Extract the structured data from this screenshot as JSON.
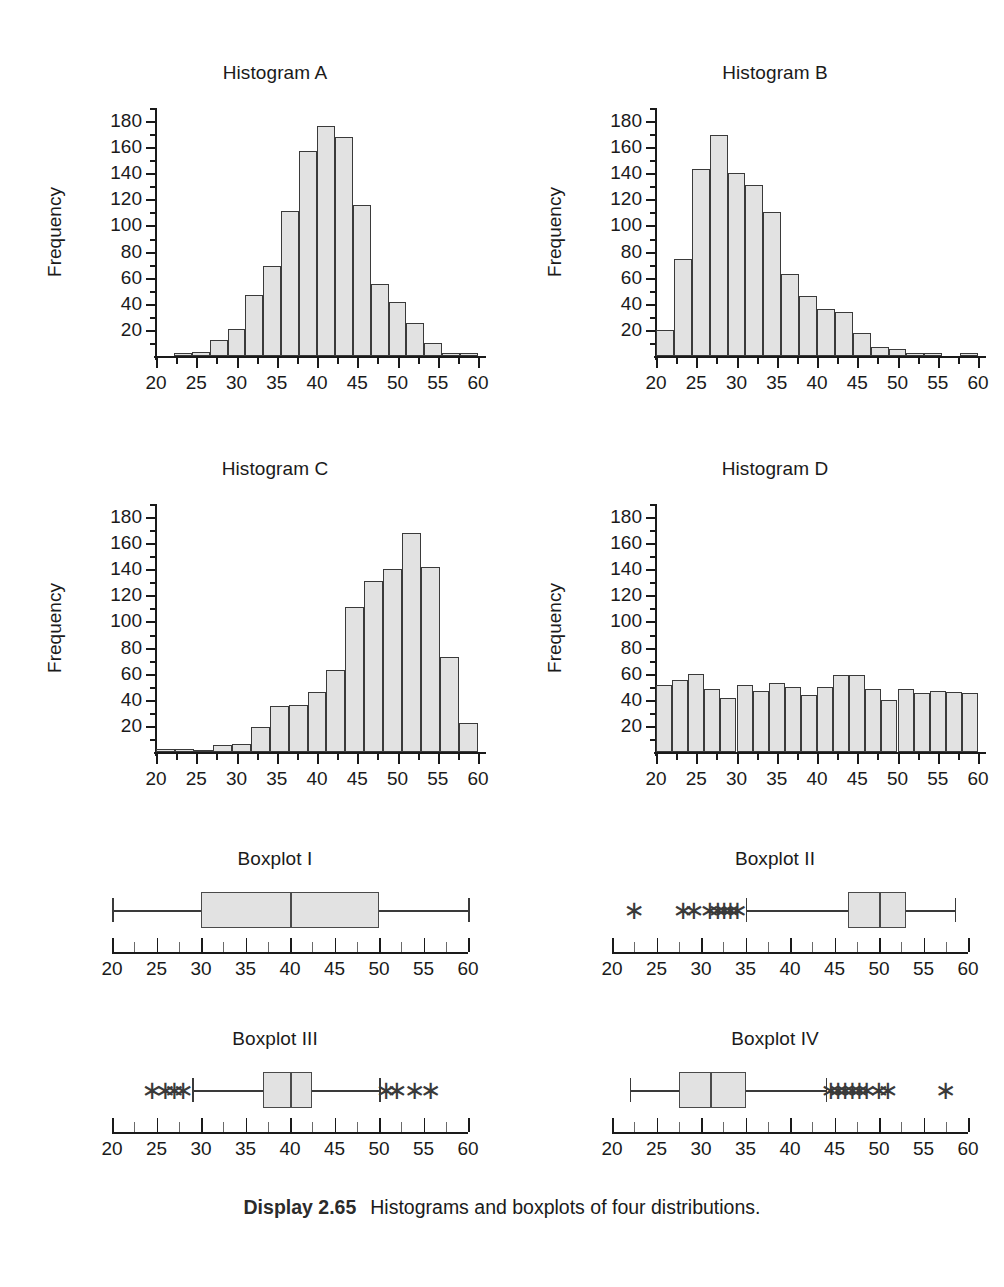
{
  "caption": {
    "lead": "Display 2.65",
    "text": "Histograms and boxplots of four distributions."
  },
  "axis": {
    "x_label_values": [
      "20",
      "25",
      "30",
      "35",
      "40",
      "45",
      "50",
      "55",
      "60"
    ],
    "y_label_values": [
      "20",
      "40",
      "60",
      "80",
      "100",
      "120",
      "140",
      "160",
      "180"
    ],
    "y_title": "Frequency",
    "x_min": 20,
    "x_max": 60,
    "y_min": 0,
    "y_max": 190
  },
  "titles": {
    "hist_a": "Histogram A",
    "hist_b": "Histogram B",
    "hist_c": "Histogram C",
    "hist_d": "Histogram D",
    "box_1": "Boxplot I",
    "box_2": "Boxplot II",
    "box_3": "Boxplot III",
    "box_4": "Boxplot IV"
  },
  "chart_data": [
    {
      "type": "bar",
      "name": "hist_a",
      "title": "Histogram A",
      "xlabel": "",
      "ylabel": "Frequency",
      "xlim": [
        20,
        60
      ],
      "ylim": [
        0,
        190
      ],
      "bin_width": 2.5,
      "grid": false,
      "shape": "symmetric / mound-shaped centered near 40",
      "bin_starts": [
        20,
        22.5,
        25,
        27.5,
        30,
        32.5,
        35,
        37.5,
        40,
        42.5,
        45,
        47.5,
        50,
        52.5,
        55,
        57.5
      ],
      "values": [
        0,
        2,
        3,
        12,
        21,
        47,
        69,
        111,
        157,
        176,
        168,
        116,
        55,
        41,
        25,
        10,
        2,
        2
      ]
    },
    {
      "type": "bar",
      "name": "hist_b",
      "title": "Histogram B",
      "xlabel": "",
      "ylabel": "Frequency",
      "xlim": [
        20,
        60
      ],
      "ylim": [
        0,
        190
      ],
      "bin_width": 2.5,
      "grid": false,
      "shape": "skewed right, peak near 28",
      "bin_starts": [
        21.5,
        23,
        25.5,
        28,
        30.5,
        33,
        35.5,
        38,
        40.5,
        43,
        45.5,
        48,
        50.5,
        53,
        57.5
      ],
      "values": [
        20,
        74,
        143,
        169,
        140,
        131,
        110,
        63,
        46,
        36,
        34,
        18,
        7,
        5,
        2,
        2,
        0,
        2
      ]
    },
    {
      "type": "bar",
      "name": "hist_c",
      "title": "Histogram C",
      "xlabel": "",
      "ylabel": "Frequency",
      "xlim": [
        20,
        60
      ],
      "ylim": [
        0,
        190
      ],
      "bin_width": 2.5,
      "grid": false,
      "shape": "skewed left, peak near 52",
      "bin_starts": [
        21,
        27.5,
        30,
        32,
        34,
        36,
        38,
        40,
        42,
        44,
        46,
        48,
        50,
        52,
        54,
        57
      ],
      "values": [
        2,
        2,
        1,
        5,
        6,
        19,
        35,
        36,
        46,
        63,
        111,
        131,
        140,
        168,
        142,
        73,
        22
      ]
    },
    {
      "type": "bar",
      "name": "hist_d",
      "title": "Histogram D",
      "xlabel": "",
      "ylabel": "Frequency",
      "xlim": [
        20,
        60
      ],
      "ylim": [
        0,
        190
      ],
      "bin_width": 2.5,
      "grid": false,
      "shape": "approximately uniform / rectangular",
      "bin_starts": [
        20,
        22.5,
        25,
        27.5,
        30,
        32.5,
        35,
        37.5,
        40,
        42.5,
        45,
        47.5,
        50,
        52.5,
        55,
        57.5
      ],
      "values": [
        51,
        55,
        60,
        48,
        41,
        51,
        47,
        53,
        50,
        44,
        50,
        59,
        59,
        48,
        40,
        48,
        45,
        47,
        46,
        45
      ]
    },
    {
      "type": "boxplot",
      "name": "box_1",
      "title": "Boxplot I",
      "xlim": [
        20,
        60
      ],
      "min_whisker": 20,
      "q1": 30,
      "median": 40,
      "q3": 50,
      "max_whisker": 60,
      "outliers": []
    },
    {
      "type": "boxplot",
      "name": "box_2",
      "title": "Boxplot II",
      "xlim": [
        20,
        60
      ],
      "min_whisker": 35,
      "q1": 46.5,
      "median": 50,
      "q3": 53,
      "max_whisker": 58.5,
      "outliers": [
        22.5,
        28,
        29.2,
        31,
        31.9,
        32.6,
        33.3,
        34.1
      ]
    },
    {
      "type": "boxplot",
      "name": "box_3",
      "title": "Boxplot III",
      "xlim": [
        20,
        60
      ],
      "min_whisker": 29,
      "q1": 37,
      "median": 40,
      "q3": 42.5,
      "max_whisker": 50,
      "outliers": [
        24.5,
        26,
        27,
        28,
        50.8,
        52,
        54,
        55.8
      ]
    },
    {
      "type": "boxplot",
      "name": "box_4",
      "title": "Boxplot IV",
      "xlim": [
        20,
        60
      ],
      "min_whisker": 22,
      "q1": 27.5,
      "median": 31,
      "q3": 35,
      "max_whisker": 44,
      "outliers": [
        44.6,
        45.4,
        46.2,
        47,
        47.8,
        48.6,
        50,
        51,
        57.5
      ]
    }
  ]
}
